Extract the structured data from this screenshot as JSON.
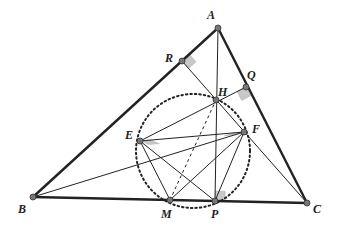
{
  "points": {
    "A": {
      "x": 218,
      "y": 28,
      "label": "A",
      "lx": 207,
      "ly": 19
    },
    "B": {
      "x": 33,
      "y": 197,
      "label": "B",
      "lx": 18,
      "ly": 213
    },
    "C": {
      "x": 307,
      "y": 203,
      "label": "C",
      "lx": 313,
      "ly": 213
    },
    "R": {
      "x": 182,
      "y": 61,
      "label": "R",
      "lx": 165,
      "ly": 62
    },
    "Q": {
      "x": 246,
      "y": 87,
      "label": "Q",
      "lx": 247,
      "ly": 79
    },
    "H": {
      "x": 216,
      "y": 100,
      "label": "H",
      "lx": 218,
      "ly": 96
    },
    "E": {
      "x": 140,
      "y": 141,
      "label": "E",
      "lx": 125,
      "ly": 139
    },
    "F": {
      "x": 244,
      "y": 132,
      "label": "F",
      "lx": 252,
      "ly": 133
    },
    "M": {
      "x": 170,
      "y": 200,
      "label": "M",
      "lx": 161,
      "ly": 218
    },
    "P": {
      "x": 215,
      "y": 201,
      "label": "P",
      "lx": 211,
      "ly": 218
    }
  },
  "circle": {
    "cx": 193,
    "cy": 151,
    "r": 57
  },
  "colors": {
    "line": "#222222",
    "point_fill": "#777777",
    "right_angle": "#c8c8c8"
  }
}
